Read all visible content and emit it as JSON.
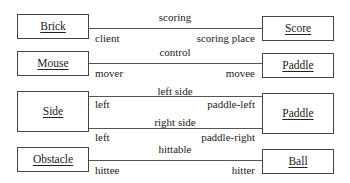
{
  "diagram": {
    "type": "uml-association-diagram",
    "associations": [
      {
        "left_class": "Brick",
        "right_class": "Score",
        "name": "scoring",
        "left_role": "client",
        "right_role": "scoring place"
      },
      {
        "left_class": "Mouse",
        "right_class": "Paddle",
        "name": "control",
        "left_role": "mover",
        "right_role": "movee"
      },
      {
        "left_class": "Side",
        "right_class": "Paddle",
        "name": "left side",
        "left_role": "left",
        "right_role": "paddle-left"
      },
      {
        "left_class": "Side",
        "right_class": "Paddle",
        "name": "right side",
        "left_role": "left",
        "right_role": "paddle-right"
      },
      {
        "left_class": "Obstacle",
        "right_class": "Ball",
        "name": "hittable",
        "left_role": "hittee",
        "right_role": "hitter"
      }
    ]
  },
  "classes": {
    "brick": "Brick",
    "score": "Score",
    "mouse": "Mouse",
    "paddle_1": "Paddle",
    "side": "Side",
    "paddle_2": "Paddle",
    "obstacle": "Obstacle",
    "ball": "Ball"
  },
  "labels": {
    "scoring": "scoring",
    "client": "client",
    "scoring_place": "scoring place",
    "control": "control",
    "mover": "mover",
    "movee": "movee",
    "left_side": "left side",
    "left_1": "left",
    "paddle_left": "paddle-left",
    "right_side": "right side",
    "left_2": "left",
    "paddle_right": "paddle-right",
    "hittable": "hittable",
    "hittee": "hittee",
    "hitter": "hitter"
  }
}
